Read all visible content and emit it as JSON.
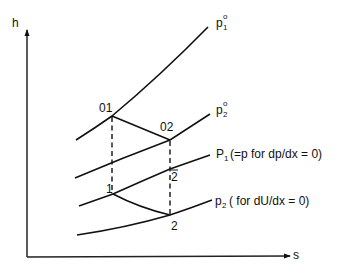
{
  "axes": {
    "y_label": "h",
    "x_label": "s"
  },
  "curves": {
    "p1_stag": {
      "name": "p",
      "sub": "1",
      "sup": "o"
    },
    "p2_stag": {
      "name": "p",
      "sub": "2",
      "sup": "o"
    },
    "p1": {
      "name": "P",
      "sub": "1",
      "note": "(=p  for dp/dx = 0)"
    },
    "p2": {
      "name": "p",
      "sub": "2",
      "note": "( for dU/dx = 0)"
    }
  },
  "points": {
    "o1": "01",
    "o2": "02",
    "s1": "1",
    "s2bar": "2",
    "s2": "2"
  },
  "colors": {
    "ink": "#111111",
    "background": "#ffffff"
  }
}
